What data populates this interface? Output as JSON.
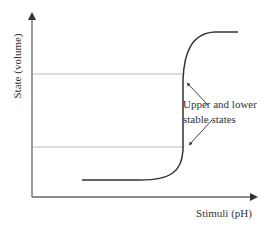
{
  "diagram": {
    "type": "hysteresis-transition-curve",
    "y_axis": {
      "label": "State (volume)"
    },
    "x_axis": {
      "label": "Stimuli (pH)"
    },
    "annotation": {
      "line1": "Upper and lower",
      "line2": "stable states"
    },
    "colors": {
      "axis": "#555555",
      "curve": "#333333",
      "guide_lines": "#bbbbbb",
      "text": "#333333"
    }
  }
}
